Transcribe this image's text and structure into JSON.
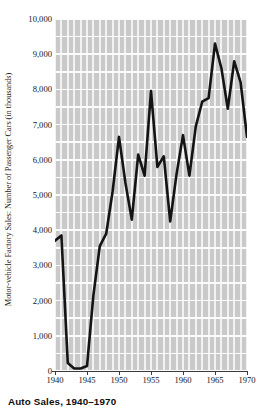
{
  "caption": "Auto Sales, 1940–1970",
  "chart_data": {
    "type": "line",
    "title": "Auto Sales, 1940–1970",
    "xlabel": "",
    "ylabel": "Motor-vehicle Factory Sales: Number of Passenger Cars (in thousands)",
    "xlim": [
      1940,
      1970
    ],
    "ylim": [
      0,
      10000
    ],
    "grid": true,
    "legend": "none",
    "y_ticks": [
      0,
      1000,
      2000,
      3000,
      4000,
      5000,
      6000,
      7000,
      8000,
      9000,
      10000
    ],
    "y_tick_labels": [
      "0",
      "1,000",
      "2,000",
      "3,000",
      "4,000",
      "5,000",
      "6,000",
      "7,000",
      "8,000",
      "9,000",
      "10,000"
    ],
    "x_ticks": [
      1940,
      1945,
      1950,
      1955,
      1960,
      1965,
      1970
    ],
    "x_tick_labels": [
      "1940",
      "1945",
      "1950",
      "1955",
      "1960",
      "1965",
      "1970"
    ],
    "x": [
      1940,
      1941,
      1942,
      1943,
      1944,
      1945,
      1946,
      1947,
      1948,
      1949,
      1950,
      1951,
      1952,
      1953,
      1954,
      1955,
      1956,
      1957,
      1958,
      1959,
      1960,
      1961,
      1962,
      1963,
      1964,
      1965,
      1966,
      1967,
      1968,
      1969,
      1970
    ],
    "values": [
      3700,
      3850,
      230,
      70,
      70,
      140,
      2150,
      3550,
      3900,
      5100,
      6650,
      5350,
      4300,
      6150,
      5550,
      7950,
      5800,
      6100,
      4250,
      5600,
      6700,
      5550,
      6950,
      7650,
      7750,
      9300,
      8600,
      7450,
      8800,
      8200,
      6650
    ],
    "series_color": "#141414",
    "plot_background": "#c9c9c9",
    "gridline_color": "#f7f7f7"
  },
  "axes": {
    "y_title": "Motor-vehicle Factory Sales: Number of Passenger Cars (in thousands)"
  }
}
